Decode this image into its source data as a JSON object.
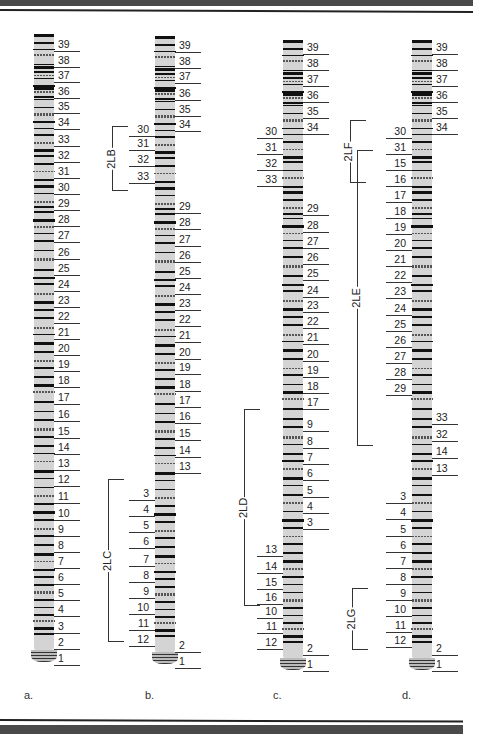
{
  "figure": {
    "panels": [
      {
        "id": "a",
        "caption": "a.",
        "chromo_x": 34,
        "chromo_top": 34,
        "chromo_bottom": 660,
        "width": 20,
        "label_side": "right",
        "labels": [
          {
            "t": "39",
            "y": 45
          },
          {
            "t": "38",
            "y": 61
          },
          {
            "t": "37",
            "y": 76
          },
          {
            "t": "36",
            "y": 92
          },
          {
            "t": "35",
            "y": 107
          },
          {
            "t": "34",
            "y": 123
          },
          {
            "t": "33",
            "y": 140
          },
          {
            "t": "32",
            "y": 156
          },
          {
            "t": "31",
            "y": 172
          },
          {
            "t": "30",
            "y": 188
          },
          {
            "t": "29",
            "y": 204
          },
          {
            "t": "28",
            "y": 220
          },
          {
            "t": "27",
            "y": 236
          },
          {
            "t": "26",
            "y": 253
          },
          {
            "t": "25",
            "y": 269
          },
          {
            "t": "24",
            "y": 285
          },
          {
            "t": "23",
            "y": 301
          },
          {
            "t": "22",
            "y": 317
          },
          {
            "t": "21",
            "y": 333
          },
          {
            "t": "20",
            "y": 349
          },
          {
            "t": "19",
            "y": 365
          },
          {
            "t": "18",
            "y": 381
          },
          {
            "t": "17",
            "y": 398
          },
          {
            "t": "16",
            "y": 415
          },
          {
            "t": "15",
            "y": 432
          },
          {
            "t": "14",
            "y": 448
          },
          {
            "t": "13",
            "y": 464
          },
          {
            "t": "12",
            "y": 480
          },
          {
            "t": "11",
            "y": 497
          },
          {
            "t": "10",
            "y": 514
          },
          {
            "t": "9",
            "y": 530
          },
          {
            "t": "8",
            "y": 546
          },
          {
            "t": "7",
            "y": 562
          },
          {
            "t": "6",
            "y": 578
          },
          {
            "t": "5",
            "y": 594
          },
          {
            "t": "4",
            "y": 610
          },
          {
            "t": "3",
            "y": 627
          },
          {
            "t": "2",
            "y": 643
          },
          {
            "t": "1",
            "y": 659
          }
        ]
      },
      {
        "id": "b",
        "caption": "b.",
        "chromo_x": 155,
        "chromo_top": 36,
        "chromo_bottom": 662,
        "width": 20,
        "labels_right": [
          {
            "t": "39",
            "y": 46
          },
          {
            "t": "38",
            "y": 62
          },
          {
            "t": "37",
            "y": 77
          },
          {
            "t": "36",
            "y": 94
          },
          {
            "t": "35",
            "y": 110
          },
          {
            "t": "34",
            "y": 125
          },
          {
            "t": "29",
            "y": 207
          },
          {
            "t": "28",
            "y": 223
          },
          {
            "t": "27",
            "y": 240
          },
          {
            "t": "26",
            "y": 256
          },
          {
            "t": "25",
            "y": 272
          },
          {
            "t": "24",
            "y": 288
          },
          {
            "t": "23",
            "y": 304
          },
          {
            "t": "22",
            "y": 320
          },
          {
            "t": "21",
            "y": 336
          },
          {
            "t": "20",
            "y": 353
          },
          {
            "t": "19",
            "y": 368
          },
          {
            "t": "18",
            "y": 385
          },
          {
            "t": "17",
            "y": 401
          },
          {
            "t": "16",
            "y": 417
          },
          {
            "t": "15",
            "y": 434
          },
          {
            "t": "14",
            "y": 451
          },
          {
            "t": "13",
            "y": 467
          },
          {
            "t": "2",
            "y": 646
          },
          {
            "t": "1",
            "y": 662
          }
        ],
        "labels_left": [
          {
            "t": "30",
            "y": 130
          },
          {
            "t": "31",
            "y": 144
          },
          {
            "t": "32",
            "y": 160
          },
          {
            "t": "33",
            "y": 177
          },
          {
            "t": "3",
            "y": 494
          },
          {
            "t": "4",
            "y": 510
          },
          {
            "t": "5",
            "y": 526
          },
          {
            "t": "6",
            "y": 542
          },
          {
            "t": "7",
            "y": 560
          },
          {
            "t": "8",
            "y": 576
          },
          {
            "t": "9",
            "y": 592
          },
          {
            "t": "10",
            "y": 608
          },
          {
            "t": "11",
            "y": 624
          },
          {
            "t": "12",
            "y": 640
          }
        ],
        "brackets": [
          {
            "label": "2LB",
            "x": 112,
            "top": 126,
            "bottom": 191
          },
          {
            "label": "2LC",
            "x": 108,
            "top": 479,
            "bottom": 642
          }
        ]
      },
      {
        "id": "c",
        "caption": "c.",
        "chromo_x": 283,
        "chromo_top": 40,
        "chromo_bottom": 668,
        "width": 20,
        "labels_right": [
          {
            "t": "39",
            "y": 48
          },
          {
            "t": "38",
            "y": 64
          },
          {
            "t": "37",
            "y": 80
          },
          {
            "t": "36",
            "y": 96
          },
          {
            "t": "35",
            "y": 112
          },
          {
            "t": "34",
            "y": 128
          },
          {
            "t": "29",
            "y": 209
          },
          {
            "t": "28",
            "y": 226
          },
          {
            "t": "27",
            "y": 242
          },
          {
            "t": "26",
            "y": 258
          },
          {
            "t": "25",
            "y": 274
          },
          {
            "t": "24",
            "y": 291
          },
          {
            "t": "23",
            "y": 306
          },
          {
            "t": "22",
            "y": 322
          },
          {
            "t": "21",
            "y": 338
          },
          {
            "t": "20",
            "y": 355
          },
          {
            "t": "19",
            "y": 371
          },
          {
            "t": "18",
            "y": 387
          },
          {
            "t": "17",
            "y": 403
          },
          {
            "t": "9",
            "y": 425
          },
          {
            "t": "8",
            "y": 442
          },
          {
            "t": "7",
            "y": 458
          },
          {
            "t": "6",
            "y": 474
          },
          {
            "t": "5",
            "y": 491
          },
          {
            "t": "4",
            "y": 507
          },
          {
            "t": "3",
            "y": 523
          },
          {
            "t": "2",
            "y": 649
          },
          {
            "t": "1",
            "y": 665
          }
        ],
        "labels_left": [
          {
            "t": "30",
            "y": 132
          },
          {
            "t": "31",
            "y": 148
          },
          {
            "t": "32",
            "y": 164
          },
          {
            "t": "33",
            "y": 180
          },
          {
            "t": "13",
            "y": 550
          },
          {
            "t": "14",
            "y": 567
          },
          {
            "t": "15",
            "y": 583
          },
          {
            "t": "16",
            "y": 598
          },
          {
            "t": "10",
            "y": 612
          },
          {
            "t": "11",
            "y": 627
          },
          {
            "t": "12",
            "y": 643
          }
        ],
        "brackets": [
          {
            "label": "2LD",
            "x": 244,
            "top": 409,
            "bottom": 606
          }
        ]
      },
      {
        "id": "d",
        "caption": "d.",
        "chromo_x": 412,
        "chromo_top": 40,
        "chromo_bottom": 668,
        "width": 20,
        "labels_right": [
          {
            "t": "39",
            "y": 48
          },
          {
            "t": "38",
            "y": 64
          },
          {
            "t": "37",
            "y": 80
          },
          {
            "t": "36",
            "y": 96
          },
          {
            "t": "35",
            "y": 112
          },
          {
            "t": "34",
            "y": 128
          },
          {
            "t": "33",
            "y": 418
          },
          {
            "t": "32",
            "y": 435
          },
          {
            "t": "14",
            "y": 452
          },
          {
            "t": "13",
            "y": 469
          },
          {
            "t": "2",
            "y": 649
          },
          {
            "t": "1",
            "y": 665
          }
        ],
        "labels_left": [
          {
            "t": "30",
            "y": 132
          },
          {
            "t": "31",
            "y": 148
          },
          {
            "t": "15",
            "y": 164
          },
          {
            "t": "16",
            "y": 180
          },
          {
            "t": "17",
            "y": 196
          },
          {
            "t": "18",
            "y": 212
          },
          {
            "t": "19",
            "y": 228
          },
          {
            "t": "20",
            "y": 244
          },
          {
            "t": "21",
            "y": 260
          },
          {
            "t": "22",
            "y": 276
          },
          {
            "t": "23",
            "y": 292
          },
          {
            "t": "24",
            "y": 309
          },
          {
            "t": "25",
            "y": 325
          },
          {
            "t": "26",
            "y": 341
          },
          {
            "t": "27",
            "y": 357
          },
          {
            "t": "28",
            "y": 373
          },
          {
            "t": "29",
            "y": 389
          },
          {
            "t": "3",
            "y": 497
          },
          {
            "t": "4",
            "y": 513
          },
          {
            "t": "5",
            "y": 530
          },
          {
            "t": "6",
            "y": 546
          },
          {
            "t": "7",
            "y": 562
          },
          {
            "t": "8",
            "y": 578
          },
          {
            "t": "9",
            "y": 594
          },
          {
            "t": "10",
            "y": 610
          },
          {
            "t": "11",
            "y": 626
          },
          {
            "t": "12",
            "y": 641
          }
        ],
        "brackets": [
          {
            "label": "2LF",
            "x": 350,
            "top": 120,
            "bottom": 183
          },
          {
            "label": "2LE",
            "x": 357,
            "top": 150,
            "bottom": 446
          },
          {
            "label": "2LG",
            "x": 352,
            "top": 588,
            "bottom": 650
          }
        ]
      }
    ],
    "band_pattern": [
      0.0,
      0.013,
      0.024,
      0.033,
      0.048,
      0.052,
      0.06,
      0.066,
      0.071,
      0.082,
      0.086,
      0.093,
      0.1,
      0.105,
      0.118,
      0.128,
      0.142,
      0.152,
      0.163,
      0.176,
      0.187,
      0.196,
      0.21,
      0.222,
      0.236,
      0.245,
      0.258,
      0.271,
      0.28,
      0.288,
      0.3,
      0.312,
      0.323,
      0.335,
      0.35,
      0.364,
      0.381,
      0.395,
      0.405,
      0.42,
      0.433,
      0.447,
      0.46,
      0.476,
      0.487,
      0.5,
      0.515,
      0.53,
      0.541,
      0.556,
      0.568,
      0.58,
      0.596,
      0.612,
      0.625,
      0.64,
      0.653,
      0.668,
      0.68,
      0.693,
      0.707,
      0.72,
      0.735,
      0.748,
      0.762,
      0.775,
      0.788,
      0.802,
      0.814,
      0.828,
      0.842,
      0.855,
      0.868,
      0.88,
      0.893,
      0.905,
      0.918,
      0.93,
      0.942,
      0.952,
      0.962,
      0.972
    ]
  },
  "colors": {
    "chromosome_fill": "#d4d4d4",
    "band": "#111111",
    "rule_bar": "#4a4a4a"
  }
}
